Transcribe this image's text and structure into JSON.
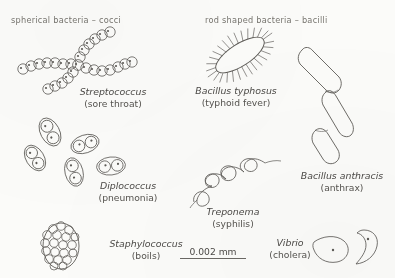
{
  "figure": {
    "background_color": "#fbfbf9",
    "ink_color": "#585652",
    "headers": {
      "cocci": "spherical bacteria – cocci",
      "bacilli": "rod shaped bacteria – bacilli"
    },
    "specimens": [
      {
        "id": "streptococcus",
        "scientific_name": "Streptococcus",
        "common_name": "(sore throat)",
        "group": "cocci",
        "morphology": "chains of spherical cells radiating from a junction"
      },
      {
        "id": "diplococcus",
        "scientific_name": "Diplococcus",
        "common_name": "(pneumonia)",
        "group": "cocci",
        "morphology": "paired spherical cells within capsules"
      },
      {
        "id": "staphylococcus",
        "scientific_name": "Staphylococcus",
        "common_name": "(boils)",
        "group": "cocci",
        "morphology": "grape-like cluster of spherical cells"
      },
      {
        "id": "bacillus-typhosus",
        "scientific_name": "Bacillus typhosus",
        "common_name": "(typhoid fever)",
        "group": "bacilli",
        "morphology": "oval rod covered with radiating flagella"
      },
      {
        "id": "bacillus-anthracis",
        "scientific_name": "Bacillus anthracis",
        "common_name": "(anthrax)",
        "group": "bacilli",
        "morphology": "chain of three elongated rods"
      },
      {
        "id": "treponema",
        "scientific_name": "Treponema",
        "common_name": "(syphilis)",
        "group": "spirochete",
        "morphology": "corkscrew spiral filament"
      },
      {
        "id": "vibrio",
        "scientific_name": "Vibrio",
        "common_name": "(cholera)",
        "group": "curved rod",
        "morphology": "two comma-shaped curved cells"
      }
    ],
    "scale_bar": {
      "label": "0.002 mm"
    }
  }
}
